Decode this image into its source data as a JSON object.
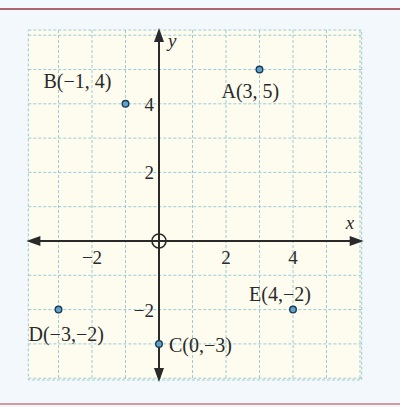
{
  "chart_data": {
    "type": "scatter",
    "title": "",
    "xlabel": "x",
    "ylabel": "y",
    "xlim": [
      -3.9,
      6.05
    ],
    "ylim": [
      -4.05,
      6.15
    ],
    "grid": true,
    "x_ticks": [
      {
        "value": -2,
        "label": "−2"
      },
      {
        "value": 2,
        "label": "2"
      },
      {
        "value": 4,
        "label": "4"
      }
    ],
    "y_ticks": [
      {
        "value": -2,
        "label": "−2"
      },
      {
        "value": 2,
        "label": "2"
      },
      {
        "value": 4,
        "label": "4"
      }
    ],
    "points": [
      {
        "name": "A",
        "x": 3,
        "y": 5,
        "label": "A(3, 5)"
      },
      {
        "name": "B",
        "x": -1,
        "y": 4,
        "label": "B(−1, 4)"
      },
      {
        "name": "C",
        "x": 0,
        "y": -3,
        "label": "C(0,−3)"
      },
      {
        "name": "D",
        "x": -3,
        "y": -2,
        "label": "D(−3,−2)"
      },
      {
        "name": "E",
        "x": 4,
        "y": -2,
        "label": "E(4,−2)"
      }
    ],
    "annotations": [
      "origin marked with circled cross"
    ]
  },
  "colors": {
    "background": "#f2f8fb",
    "plot_background": "#fdfcef",
    "grid": "#9ccad6",
    "axis": "#2a2a2a",
    "point_fill": "#5fa3c7",
    "point_stroke": "#1e3a5a",
    "rule": "#b0646e"
  }
}
